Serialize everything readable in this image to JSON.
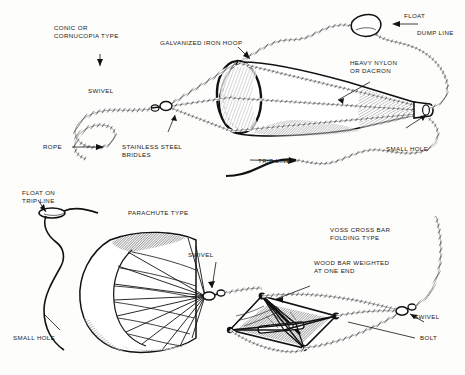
{
  "figure": {
    "background_color": "#fdfdfb",
    "ink_color": "#1a1a1a",
    "panels": [
      {
        "id": "conic",
        "heading": "CONIC OR\nCORNUCOPIA TYPE",
        "labels": [
          "GALVANIZED IRON HOOP",
          "SWIVEL",
          "ROPE",
          "STAINLESS STEEL\nBRIDLES",
          "HEAVY NYLON\nOR DACRON",
          "FLOAT",
          "DUMP LINE",
          "SMALL HOLE",
          "TRIP LINE"
        ]
      },
      {
        "id": "parachute",
        "heading": "PARACHUTE TYPE",
        "labels": [
          "FLOAT ON\nTRIP LINE",
          "SWIVEL",
          "SMALL HOLE"
        ]
      },
      {
        "id": "voss",
        "heading": "VOSS CROSS BAR\nFOLDING TYPE",
        "labels": [
          "WOOD BAR WEIGHTED\nAT ONE END",
          "SWIVEL",
          "BOLT"
        ]
      }
    ]
  },
  "labels": {
    "conic_heading_line1": "CONIC OR",
    "conic_heading_line2": "CORNUCOPIA TYPE",
    "galvanized_iron_hoop": "GALVANIZED IRON HOOP",
    "swivel_top": "SWIVEL",
    "rope": "ROPE",
    "stainless_line1": "STAINLESS STEEL",
    "stainless_line2": "BRIDLES",
    "heavy_nylon_line1": "HEAVY NYLON",
    "heavy_nylon_line2": "OR DACRON",
    "float": "FLOAT",
    "dump_line": "DUMP LINE",
    "small_hole_top": "SMALL HOLE",
    "trip_line": "TRIP LINE",
    "float_on_line1": "FLOAT ON",
    "float_on_line2": "TRIP LINE",
    "parachute_type": "PARACHUTE TYPE",
    "swivel_parachute": "SWIVEL",
    "small_hole_parachute": "SMALL HOLE",
    "voss_line1": "VOSS CROSS BAR",
    "voss_line2": "FOLDING TYPE",
    "wood_bar_line1": "WOOD BAR WEIGHTED",
    "wood_bar_line2": "AT ONE END",
    "swivel_voss": "SWIVEL",
    "bolt": "BOLT"
  }
}
